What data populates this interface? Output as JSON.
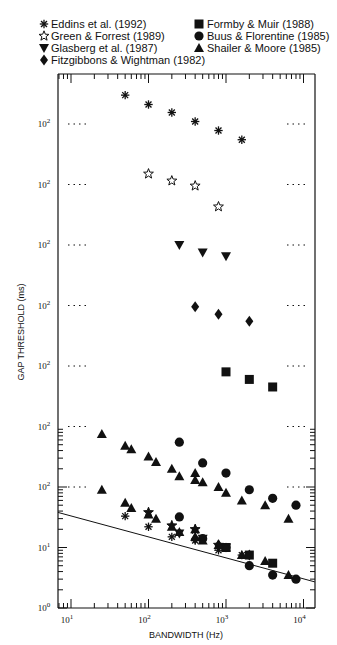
{
  "chart_data": {
    "type": "scatter",
    "title": "",
    "xlabel": "BANDWIDTH (Hz)",
    "ylabel": "GAP THRESHOLD (ms)",
    "xscale": "log",
    "yscale": "log",
    "xlim": [
      6,
      14000
    ],
    "xticks": [
      "10^1",
      "10^2",
      "10^3",
      "10^4"
    ],
    "ylim_bottom_panel": [
      1,
      100
    ],
    "yticks_bottom": [
      "10^0",
      "10^1",
      "10^2"
    ],
    "note": "Series are vertically offset by one decade each; each offset panel has its own 10^2 reference label with dotted guide lines.",
    "legend_position": "top",
    "grid": false,
    "regression_line": {
      "x": [
        6.8,
        14000
      ],
      "y": [
        38,
        2.7
      ]
    },
    "series": [
      {
        "name": "Eddins et al. (1992)",
        "marker": "asterisk",
        "offset_decades": 6,
        "x": [
          50,
          100,
          200,
          400,
          800,
          1600
        ],
        "y_offset_panel": [
          300,
          210,
          155,
          110,
          78,
          55
        ],
        "y": [
          33,
          22,
          15,
          13,
          9,
          7.5
        ]
      },
      {
        "name": "Green & Forrest (1989)",
        "marker": "open-star",
        "offset_decades": 5,
        "x": [
          100,
          200,
          400,
          800
        ],
        "y_offset_panel": [
          150,
          115,
          95,
          43
        ],
        "y": [
          38,
          23,
          20,
          11
        ]
      },
      {
        "name": "Glasberg et al. (1987)",
        "marker": "down-triangle",
        "offset_decades": 4,
        "x": [
          250,
          500,
          1000
        ],
        "y_offset_panel": [
          100,
          75,
          65
        ],
        "y": [
          17,
          14,
          10
        ]
      },
      {
        "name": "Fitzgibbons & Wightman (1982)",
        "marker": "diamond",
        "offset_decades": 3,
        "x": [
          400,
          800,
          2000
        ],
        "y_offset_panel": [
          95,
          72,
          55
        ],
        "y": [
          14,
          11,
          7.5
        ]
      },
      {
        "name": "Formby & Muir (1988)",
        "marker": "filled-square",
        "offset_decades": 2,
        "x": [
          1000,
          2000,
          4000
        ],
        "y_offset_panel": [
          80,
          60,
          45
        ],
        "y": [
          10,
          7.5,
          5.5
        ]
      },
      {
        "name": "Buus & Florentine (1985)",
        "marker": "filled-circle",
        "offset_decades": 1,
        "x": [
          250,
          500,
          1000,
          2000,
          4000,
          8000
        ],
        "y_offset_panel": [
          55,
          25,
          17,
          9,
          6.5,
          5
        ],
        "y": [
          32,
          14,
          10,
          5,
          3.5,
          3
        ]
      },
      {
        "name": "Shailer & Moore (1985)",
        "marker": "filled-triangle",
        "offset_decades": 1,
        "x": [
          25,
          50,
          60,
          100,
          125,
          200,
          250,
          400,
          400,
          500,
          800,
          1000,
          1600,
          3200,
          6400
        ],
        "y_offset_panel": [
          75,
          48,
          42,
          32,
          26,
          20,
          15,
          17,
          13,
          12,
          10,
          8,
          6,
          5,
          3
        ],
        "y_bottom_panel": [
          9,
          6,
          5,
          3.5,
          3,
          2.2,
          1.6,
          2,
          1.5,
          1.3,
          1.1,
          0.9,
          0.7,
          0.55,
          0.35
        ],
        "y": [
          90,
          55,
          45,
          35,
          30,
          22,
          18,
          20,
          15,
          13,
          11,
          10,
          7.5,
          6,
          3.5
        ]
      }
    ]
  },
  "legend": {
    "items": [
      {
        "symbol": "asterisk",
        "label": "Eddins et al. (1992)"
      },
      {
        "symbol": "open-star",
        "label": "Green & Forrest (1989)"
      },
      {
        "symbol": "down-triangle",
        "label": "Glasberg et al. (1987)"
      },
      {
        "symbol": "diamond",
        "label": "Fitzgibbons & Wightman (1982)"
      },
      {
        "symbol": "filled-square",
        "label": "Formby & Muir (1988)"
      },
      {
        "symbol": "filled-circle",
        "label": "Buus & Florentine (1985)"
      },
      {
        "symbol": "filled-triangle",
        "label": "Shailer & Moore (1985)"
      }
    ]
  },
  "axes": {
    "x_title": "BANDWIDTH (Hz)",
    "y_title": "GAP THRESHOLD (ms)",
    "x_tick_labels": [
      {
        "base": "10",
        "exp": "1"
      },
      {
        "base": "10",
        "exp": "2"
      },
      {
        "base": "10",
        "exp": "3"
      },
      {
        "base": "10",
        "exp": "4"
      }
    ],
    "y_tick_labels_bottom": [
      {
        "base": "10",
        "exp": "0"
      },
      {
        "base": "10",
        "exp": "1"
      }
    ],
    "y_panel_label": {
      "base": "10",
      "exp": "2"
    }
  }
}
